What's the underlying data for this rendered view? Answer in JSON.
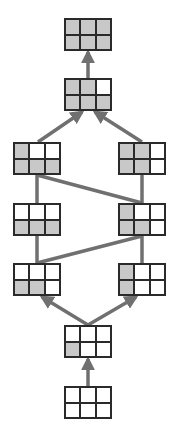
{
  "colors": {
    "filled": "#c8c8c8",
    "empty": "#ffffff",
    "border": "#2a2a2a",
    "edge": "#707070"
  },
  "nodes": [
    {
      "id": "n1",
      "x": 64,
      "y": 18,
      "cells": [
        1,
        1,
        1,
        1,
        1,
        1
      ]
    },
    {
      "id": "n2",
      "x": 64,
      "y": 78,
      "cells": [
        1,
        1,
        0,
        1,
        1,
        1
      ]
    },
    {
      "id": "n3l",
      "x": 13,
      "y": 142,
      "cells": [
        1,
        0,
        0,
        1,
        1,
        1
      ]
    },
    {
      "id": "n3r",
      "x": 118,
      "y": 142,
      "cells": [
        1,
        1,
        0,
        1,
        1,
        0
      ]
    },
    {
      "id": "n4l",
      "x": 13,
      "y": 203,
      "cells": [
        0,
        0,
        0,
        1,
        1,
        1
      ]
    },
    {
      "id": "n4r",
      "x": 118,
      "y": 203,
      "cells": [
        1,
        0,
        0,
        1,
        1,
        0
      ]
    },
    {
      "id": "n5l",
      "x": 13,
      "y": 263,
      "cells": [
        0,
        0,
        0,
        1,
        1,
        0
      ]
    },
    {
      "id": "n5r",
      "x": 118,
      "y": 263,
      "cells": [
        1,
        0,
        0,
        1,
        0,
        0
      ]
    },
    {
      "id": "n6",
      "x": 64,
      "y": 325,
      "cells": [
        0,
        0,
        0,
        1,
        0,
        0
      ]
    },
    {
      "id": "n7",
      "x": 64,
      "y": 386,
      "cells": [
        0,
        0,
        0,
        0,
        0,
        0
      ]
    }
  ],
  "edges": [
    {
      "from": "n2",
      "to": "n1",
      "x1": 88,
      "y1": 78,
      "x2": 88,
      "y2": 52,
      "arrow": true
    },
    {
      "from": "n3l",
      "to": "n2",
      "x1": 38,
      "y1": 142,
      "x2": 82,
      "y2": 112,
      "arrow": true
    },
    {
      "from": "n3r",
      "to": "n2",
      "x1": 142,
      "y1": 142,
      "x2": 95,
      "y2": 112,
      "arrow": true
    },
    {
      "from": "n3l",
      "to": "n4l",
      "x1": 37,
      "y1": 175,
      "x2": 37,
      "y2": 203,
      "arrow": false
    },
    {
      "from": "n3r",
      "to": "n4r",
      "x1": 142,
      "y1": 175,
      "x2": 142,
      "y2": 203,
      "arrow": false
    },
    {
      "from": "n3l",
      "to": "n4r",
      "x1": 37,
      "y1": 175,
      "x2": 142,
      "y2": 203,
      "arrow": false
    },
    {
      "from": "n4l",
      "to": "n5l",
      "x1": 37,
      "y1": 236,
      "x2": 37,
      "y2": 263,
      "arrow": false
    },
    {
      "from": "n4r",
      "to": "n5r",
      "x1": 142,
      "y1": 236,
      "x2": 142,
      "y2": 263,
      "arrow": false
    },
    {
      "from": "n4r",
      "to": "n5l",
      "x1": 142,
      "y1": 236,
      "x2": 37,
      "y2": 263,
      "arrow": false
    },
    {
      "from": "n6",
      "to": "n5l",
      "x1": 88,
      "y1": 325,
      "x2": 42,
      "y2": 297,
      "arrow": true
    },
    {
      "from": "n6",
      "to": "n5r",
      "x1": 88,
      "y1": 325,
      "x2": 136,
      "y2": 297,
      "arrow": true
    },
    {
      "from": "n7",
      "to": "n6",
      "x1": 88,
      "y1": 386,
      "x2": 88,
      "y2": 359,
      "arrow": true
    }
  ]
}
